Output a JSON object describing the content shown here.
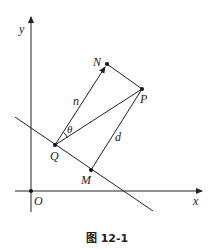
{
  "figure": {
    "caption": "图 12-1",
    "axes": {
      "x_label": "x",
      "y_label": "y",
      "origin_label": "O"
    },
    "points": {
      "Q": "Q",
      "N": "N",
      "P": "P",
      "M": "M"
    },
    "segment_labels": {
      "n": "n",
      "d": "d",
      "theta": "θ"
    },
    "colors": {
      "stroke": "#222222",
      "background": "#ffffff"
    }
  }
}
